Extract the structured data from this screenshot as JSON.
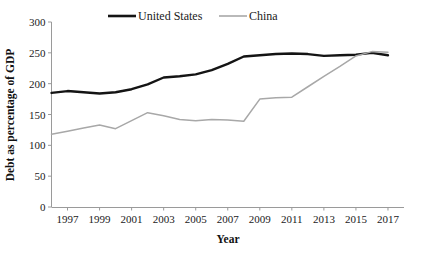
{
  "chart_data": {
    "type": "line",
    "title": "",
    "xlabel": "Year",
    "ylabel": "Debt as percentage of GDP",
    "xlim": [
      1996,
      2018
    ],
    "ylim": [
      0,
      300
    ],
    "ytick_step": 50,
    "xtick_step": 2,
    "grid": false,
    "legend_position": "top-center",
    "yticks": [
      0,
      50,
      100,
      150,
      200,
      250,
      300
    ],
    "xticks": [
      1997,
      1999,
      2001,
      2003,
      2005,
      2007,
      2009,
      2011,
      2013,
      2015,
      2017
    ],
    "x": [
      1996,
      1997,
      1998,
      1999,
      2000,
      2001,
      2002,
      2003,
      2004,
      2005,
      2006,
      2007,
      2008,
      2009,
      2010,
      2011,
      2012,
      2013,
      2014,
      2015,
      2016,
      2017
    ],
    "series": [
      {
        "name": "United States",
        "color": "#141414",
        "width": 2.4,
        "values": [
          185,
          188,
          186,
          184,
          186,
          191,
          199,
          210,
          212,
          215,
          222,
          232,
          244,
          246,
          248,
          249,
          248,
          245,
          246,
          247,
          250,
          246
        ]
      },
      {
        "name": "China",
        "color": "#a8a8a8",
        "width": 1.5,
        "values": [
          118,
          123,
          128,
          133,
          127,
          140,
          153,
          148,
          142,
          140,
          142,
          141,
          139,
          175,
          177,
          178,
          195,
          212,
          228,
          245,
          252,
          251
        ]
      }
    ]
  },
  "legend": {
    "entries": [
      {
        "label": "United States"
      },
      {
        "label": "China"
      }
    ]
  },
  "axes": {
    "x_title": "Year",
    "y_title": "Debt as percentage of GDP"
  }
}
